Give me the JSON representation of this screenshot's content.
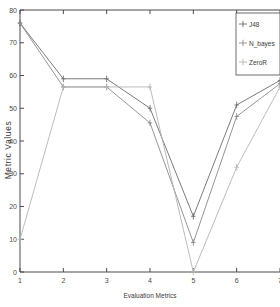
{
  "chart_data": {
    "type": "line",
    "title": "",
    "xlabel": "Evaluation Metrics",
    "ylabel": "Metric Values",
    "x": [
      1,
      2,
      3,
      4,
      5,
      6,
      7
    ],
    "xticklabels": [
      "1",
      "2",
      "3",
      "4",
      "5",
      "6",
      "7"
    ],
    "yticklabels": [
      "0",
      "10",
      "20",
      "30",
      "40",
      "50",
      "60",
      "70",
      "80"
    ],
    "yticks": [
      0,
      10,
      20,
      30,
      40,
      50,
      60,
      70,
      80
    ],
    "xlim": [
      1,
      7
    ],
    "ylim": [
      0,
      80
    ],
    "grid": false,
    "legend_position": "top-right",
    "markers": "plus",
    "series": [
      {
        "name": "J48",
        "color": "#6d6d6d",
        "values": [
          76.0,
          59.0,
          59.0,
          50.0,
          17.0,
          51.0,
          58.5
        ]
      },
      {
        "name": "N_bayes",
        "color": "#8a8a8a",
        "values": [
          76.0,
          56.5,
          56.5,
          45.5,
          9.0,
          47.5,
          57.5
        ]
      },
      {
        "name": "ZeroR",
        "color": "#b4b4b4",
        "values": [
          10.0,
          56.5,
          56.5,
          56.5,
          0.0,
          32.0,
          56.5
        ]
      }
    ]
  },
  "legend": {
    "entries": [
      {
        "label": "J48"
      },
      {
        "label": "N_bayes"
      },
      {
        "label": "ZeroR"
      }
    ]
  },
  "axes": {
    "x_title": "Evaluation Metrics",
    "y_title": "Metric Values"
  }
}
